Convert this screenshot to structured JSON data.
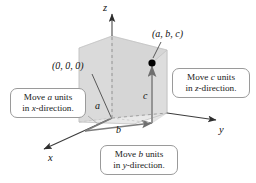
{
  "figure": {
    "background_color": "#ffffff",
    "box_fill_color": "#d9d9d9",
    "axis_color": "#3a3a3a",
    "point_color": "#000000"
  },
  "axes": [
    {
      "name": "z-axis",
      "label": "z",
      "direction": "up"
    },
    {
      "name": "y-axis",
      "label": "y",
      "direction": "right"
    },
    {
      "name": "x-axis",
      "label": "x",
      "direction": "down-left"
    }
  ],
  "points": [
    {
      "name": "origin",
      "label": "(0, 0, 0)"
    },
    {
      "name": "target-point",
      "label": "(a, b, c)"
    }
  ],
  "segments": [
    {
      "name": "a-segment",
      "label": "a",
      "axis": "x"
    },
    {
      "name": "b-segment",
      "label": "b",
      "axis": "y"
    },
    {
      "name": "c-segment",
      "label": "c",
      "axis": "z"
    }
  ],
  "callouts": {
    "x": {
      "line1_pre": "Move ",
      "line1_var": "a",
      "line1_post": " units",
      "line2_pre": "in ",
      "line2_var": "x",
      "line2_post": "-direction."
    },
    "y": {
      "line1_pre": "Move ",
      "line1_var": "b",
      "line1_post": " units",
      "line2_pre": "in ",
      "line2_var": "y",
      "line2_post": "-direction."
    },
    "z": {
      "line1_pre": "Move ",
      "line1_var": "c",
      "line1_post": " units",
      "line2_pre": "in ",
      "line2_var": "z",
      "line2_post": "-direction."
    }
  }
}
